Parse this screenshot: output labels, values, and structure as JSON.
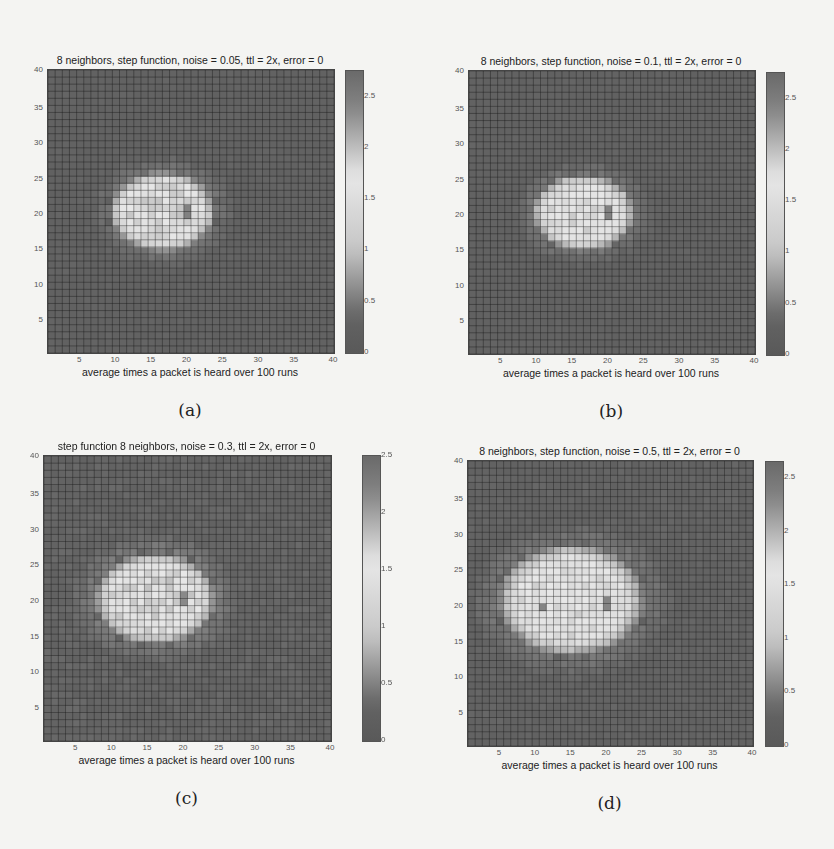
{
  "figure": {
    "panels": [
      {
        "id": "a",
        "caption": "(a)",
        "title": "8 neighbors, step function, noise = 0.05, ttl = 2x, error = 0",
        "xlabel": "average times a packet is heard over 100 runs",
        "left": 0,
        "top": 0,
        "plot": {
          "x": 47,
          "y": 69,
          "w": 286,
          "h": 283
        },
        "cbar": {
          "x": 345,
          "y": 70,
          "w": 17,
          "h": 282
        },
        "cmax": 2.75,
        "cbticks": [
          "2.5",
          "2",
          "1.5",
          "1",
          "0.5",
          "0"
        ],
        "blob": {
          "cx": 16.5,
          "cy": 20.5,
          "rx": 6.2,
          "ry": 4.8,
          "peak": 1.75,
          "dark": [
            [
              20,
              21
            ],
            [
              20,
              20
            ]
          ]
        }
      },
      {
        "id": "b",
        "caption": "(b)",
        "title": "8 neighbors, step function, noise = 0.1, ttl = 2x, error = 0",
        "xlabel": "average times a packet is heard over 100 runs",
        "left": 0,
        "top": 0,
        "plot": {
          "x": 468,
          "y": 70,
          "w": 286,
          "h": 283
        },
        "cbar": {
          "x": 766,
          "y": 72,
          "w": 17,
          "h": 282
        },
        "cmax": 2.75,
        "cbticks": [
          "2.5",
          "2",
          "1.5",
          "1",
          "0.5",
          "0"
        ],
        "blob": {
          "cx": 16.5,
          "cy": 20.5,
          "rx": 6.0,
          "ry": 4.6,
          "peak": 1.7,
          "dark": [
            [
              20,
              21
            ],
            [
              20,
              20
            ]
          ]
        }
      },
      {
        "id": "c",
        "caption": "(c)",
        "title": "step function 8 neighbors, noise = 0.3, ttl = 2x, error = 0",
        "xlabel": "average times a packet is heard over 100 runs",
        "left": 0,
        "top": 0,
        "plot": {
          "x": 43,
          "y": 455,
          "w": 287,
          "h": 285
        },
        "cbar": {
          "x": 362,
          "y": 455,
          "w": 17,
          "h": 285
        },
        "cmax": 2.5,
        "cbticks": [
          "2.5",
          "2",
          "1.5",
          "1",
          "0.5",
          "0"
        ],
        "blob": {
          "cx": 16.0,
          "cy": 20.5,
          "rx": 7.0,
          "ry": 5.4,
          "peak": 1.6,
          "dark": [
            [
              20,
              21
            ],
            [
              20,
              20
            ]
          ]
        }
      },
      {
        "id": "d",
        "caption": "(d)",
        "title": "8 neighbors, step function, noise = 0.5, ttl = 2x, error = 0",
        "xlabel": "average times a packet is heard over 100 runs",
        "left": 0,
        "top": 0,
        "plot": {
          "x": 467,
          "y": 460,
          "w": 285,
          "h": 285
        },
        "cbar": {
          "x": 765,
          "y": 461,
          "w": 17,
          "h": 284
        },
        "cmax": 2.65,
        "cbticks": [
          "2.5",
          "2",
          "1.5",
          "1",
          "0.5",
          "0"
        ],
        "blob": {
          "cx": 15.0,
          "cy": 21.0,
          "rx": 8.6,
          "ry": 6.6,
          "peak": 1.6,
          "dark": [
            [
              20,
              21
            ],
            [
              20,
              20
            ],
            [
              11,
              20
            ]
          ]
        }
      }
    ],
    "xticks": [
      "5",
      "10",
      "15",
      "20",
      "25",
      "30",
      "35",
      "40"
    ],
    "yticks": [
      "40",
      "35",
      "30",
      "25",
      "20",
      "15",
      "10",
      "5"
    ]
  },
  "chart_data": [
    {
      "type": "heatmap",
      "title": "8 neighbors, step function, noise = 0.05, ttl = 2x, error = 0",
      "xlabel": "average times a packet is heard over 100 runs",
      "ylabel": "",
      "xlim": [
        1,
        40
      ],
      "ylim": [
        1,
        40
      ],
      "xticks": [
        5,
        10,
        15,
        20,
        25,
        30,
        35,
        40
      ],
      "yticks": [
        5,
        10,
        15,
        20,
        25,
        30,
        35,
        40
      ],
      "colorbar": {
        "range": [
          0,
          2.75
        ],
        "ticks": [
          0,
          0.5,
          1,
          1.5,
          2,
          2.5
        ]
      },
      "description": "Background ~0.3; bright elliptical blob centered near (16,20), spanning x≈10–23, y≈15–25, values ≈1.5–1.8; dark cells at (20,20)-(20,21)",
      "grid_on": true,
      "caption": "(a)"
    },
    {
      "type": "heatmap",
      "title": "8 neighbors, step function, noise = 0.1, ttl = 2x, error = 0",
      "xlabel": "average times a packet is heard over 100 runs",
      "ylabel": "",
      "xlim": [
        1,
        40
      ],
      "ylim": [
        1,
        40
      ],
      "xticks": [
        5,
        10,
        15,
        20,
        25,
        30,
        35,
        40
      ],
      "yticks": [
        5,
        10,
        15,
        20,
        25,
        30,
        35,
        40
      ],
      "colorbar": {
        "range": [
          0,
          2.75
        ],
        "ticks": [
          0,
          0.5,
          1,
          1.5,
          2,
          2.5
        ]
      },
      "description": "Background ~0.3; blob centered near (16,20), spanning x≈10–23, y≈15–25; dark cells at (20,20)-(20,21)",
      "grid_on": true,
      "caption": "(b)"
    },
    {
      "type": "heatmap",
      "title": "step function 8 neighbors, noise = 0.3, ttl = 2x, error = 0",
      "xlabel": "average times a packet is heard over 100 runs",
      "ylabel": "",
      "xlim": [
        1,
        40
      ],
      "ylim": [
        1,
        40
      ],
      "xticks": [
        5,
        10,
        15,
        20,
        25,
        30,
        35,
        40
      ],
      "yticks": [
        5,
        10,
        15,
        20,
        25,
        30,
        35,
        40
      ],
      "colorbar": {
        "range": [
          0,
          2.5
        ],
        "ticks": [
          0,
          0.5,
          1,
          1.5,
          2,
          2.5
        ]
      },
      "description": "Background ~0.3; wider blob centered near (16,20), spanning x≈9–24, y≈14–26; dark cells at (20,20)-(20,21)",
      "grid_on": true,
      "caption": "(c)"
    },
    {
      "type": "heatmap",
      "title": "8 neighbors, step function, noise = 0.5, ttl = 2x, error = 0",
      "xlabel": "average times a packet is heard over 100 runs",
      "ylabel": "",
      "xlim": [
        1,
        40
      ],
      "ylim": [
        1,
        40
      ],
      "xticks": [
        5,
        10,
        15,
        20,
        25,
        30,
        35,
        40
      ],
      "yticks": [
        5,
        10,
        15,
        20,
        25,
        30,
        35,
        40
      ],
      "colorbar": {
        "range": [
          0,
          2.65
        ],
        "ticks": [
          0,
          0.5,
          1,
          1.5,
          2,
          2.5
        ]
      },
      "description": "Background ~0.3; widest blob centered near (15,21), spanning x≈6–24, y≈13–28; dark cells at (20,20)-(20,21) and (11,20)",
      "grid_on": true,
      "caption": "(d)"
    }
  ]
}
